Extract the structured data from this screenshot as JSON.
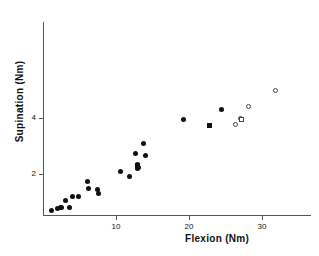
{
  "chart_data": {
    "type": "scatter",
    "title": "",
    "subtitle": "",
    "xlabel": "Flexion  (Nm)",
    "ylabel": "Supination  (Nm)",
    "xlim": [
      0,
      36.7
    ],
    "ylim": [
      0,
      5.9
    ],
    "xticks": [
      10,
      20,
      30
    ],
    "xtick_labels": [
      "10",
      "20",
      "30"
    ],
    "yticks": [
      2,
      4
    ],
    "ytick_labels": [
      "2",
      "4"
    ],
    "grid": false,
    "legend": "none",
    "series": [
      {
        "name": "filled-circle",
        "marker": "filled-circle",
        "color": "#111111",
        "points": [
          [
            1.1,
            0.68
          ],
          [
            2.0,
            0.78
          ],
          [
            2.4,
            0.8
          ],
          [
            2.6,
            0.82
          ],
          [
            3.1,
            1.05
          ],
          [
            3.6,
            0.82
          ],
          [
            4.1,
            1.18
          ],
          [
            4.9,
            1.18
          ],
          [
            6.1,
            1.72
          ],
          [
            6.3,
            1.5
          ],
          [
            7.4,
            1.45
          ],
          [
            7.6,
            1.3
          ],
          [
            10.6,
            2.08
          ],
          [
            11.9,
            1.9
          ],
          [
            12.7,
            2.72
          ],
          [
            13.0,
            2.35
          ],
          [
            13.0,
            2.18
          ],
          [
            13.1,
            2.25
          ],
          [
            13.7,
            3.08
          ],
          [
            14.0,
            2.65
          ],
          [
            19.2,
            3.95
          ],
          [
            24.5,
            4.3
          ]
        ]
      },
      {
        "name": "filled-square",
        "marker": "filled-square",
        "color": "#111111",
        "points": [
          [
            12.9,
            2.3
          ],
          [
            22.8,
            3.72
          ]
        ]
      },
      {
        "name": "open-circle",
        "marker": "open-circle",
        "color": "#444444",
        "points": [
          [
            26.4,
            3.78
          ],
          [
            27.0,
            3.98
          ],
          [
            28.1,
            4.42
          ],
          [
            31.8,
            5.0
          ]
        ]
      },
      {
        "name": "open-square",
        "marker": "open-square",
        "color": "#444444",
        "points": [
          [
            27.2,
            3.95
          ]
        ]
      }
    ]
  },
  "axes": {
    "x_title": "Flexion  (Nm)",
    "y_title": "Supination  (Nm)"
  }
}
